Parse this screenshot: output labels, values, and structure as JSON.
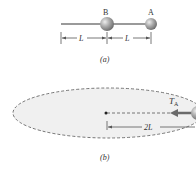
{
  "panel_a": {
    "caption": "(a)",
    "ball_b_label": "B",
    "ball_a_label": "A",
    "dim_left_label": "L",
    "dim_right_label": "L"
  },
  "panel_b": {
    "caption": "(b)",
    "tension_label_main": "T",
    "tension_label_sub": "A",
    "radius_label": "2L"
  },
  "colors": {
    "rod": "#9a9a9a",
    "ball": "#a8a8a8",
    "ellipse_fill": "#f0f0f0",
    "ellipse_stroke": "#555555",
    "arrow": "#6a6a6a"
  }
}
